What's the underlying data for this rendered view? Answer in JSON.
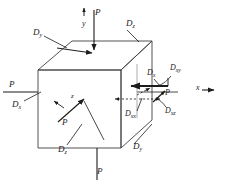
{
  "figure": {
    "type": "engineering-diagram",
    "background_color": "#ffffff",
    "line_color": "#1c1c1c",
    "cube_edge_color": "#3a3a3a"
  },
  "axes": [
    {
      "id": "y-axis",
      "label": "y",
      "direction": "up",
      "x": 84,
      "y": 18
    },
    {
      "id": "x-axis",
      "label": "x",
      "direction": "right",
      "x": 196,
      "y": 88
    },
    {
      "id": "z-axis",
      "label": "z",
      "direction": "up-left",
      "x": 71,
      "y": 97
    }
  ],
  "load_labels": [
    {
      "id": "load-top",
      "text": "P",
      "x": 95,
      "y": 13
    },
    {
      "id": "load-left",
      "text": "P",
      "x": 9,
      "y": 83
    },
    {
      "id": "load-bottom",
      "text": "P",
      "x": 97,
      "y": 170
    },
    {
      "id": "load-interior",
      "text": "P",
      "x": 63,
      "y": 116
    },
    {
      "id": "load-right",
      "text": "P",
      "x": 165,
      "y": 93
    }
  ],
  "component_labels": [
    {
      "id": "d-top-left",
      "base": "D",
      "sub": "y",
      "x": 36,
      "y": 33
    },
    {
      "id": "d-top-right",
      "base": "D",
      "sub": "z",
      "x": 128,
      "y": 24
    },
    {
      "id": "d-left-face",
      "base": "D",
      "sub": "x",
      "x": 14,
      "y": 104
    },
    {
      "id": "d-bottom-left",
      "base": "D",
      "sub": "z",
      "x": 61,
      "y": 149
    },
    {
      "id": "d-bottom-right",
      "base": "D",
      "sub": "y",
      "x": 135,
      "y": 146
    },
    {
      "id": "d-right-x",
      "base": "D",
      "sub": "x",
      "x": 149,
      "y": 73
    },
    {
      "id": "d-right-xy",
      "base": "D",
      "sub": "xy",
      "x": 172,
      "y": 69
    },
    {
      "id": "d-right-xx",
      "base": "D",
      "sub": "xx",
      "x": 127,
      "y": 113
    },
    {
      "id": "d-right-xz",
      "base": "D",
      "sub": "xz",
      "x": 167,
      "y": 110
    }
  ]
}
